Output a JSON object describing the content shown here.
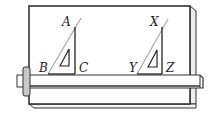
{
  "figure": {
    "type": "drawing-board-with-set-squares",
    "colors": {
      "stroke": "#333333",
      "board": "#ffffff",
      "board_edge": "#e8e8e8",
      "knob": "#c8c8c8",
      "hypotenuse": "#aaaaaa"
    },
    "triangles": [
      {
        "name": "triangle-abc",
        "vertices": {
          "top": "A",
          "bottom_left": "B",
          "bottom_right": "C"
        },
        "symbol": "Δ"
      },
      {
        "name": "triangle-xyz",
        "vertices": {
          "top": "X",
          "bottom_left": "Y",
          "bottom_right": "Z"
        },
        "symbol": "Δ"
      }
    ]
  }
}
